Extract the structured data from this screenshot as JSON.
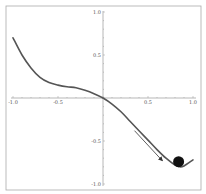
{
  "chart_data": {
    "type": "line",
    "title": "",
    "xlabel": "",
    "ylabel": "",
    "xlim": [
      -1.0,
      1.0
    ],
    "ylim": [
      -1.0,
      1.0
    ],
    "grid": false,
    "x_ticks": [
      "-1.0",
      "-0.5",
      "0.5",
      "1.0"
    ],
    "y_ticks": [
      "1.0",
      "0.5",
      "-0.5",
      "-1.0"
    ],
    "series": [
      {
        "name": "potential curve",
        "x": [
          -1.0,
          -0.9,
          -0.8,
          -0.7,
          -0.6,
          -0.5,
          -0.4,
          -0.3,
          -0.2,
          -0.1,
          0.0,
          0.1,
          0.2,
          0.3,
          0.4,
          0.5,
          0.6,
          0.7,
          0.8,
          0.85,
          0.9,
          1.0
        ],
        "y": [
          0.7,
          0.5,
          0.35,
          0.24,
          0.18,
          0.15,
          0.13,
          0.12,
          0.09,
          0.05,
          0.0,
          -0.07,
          -0.16,
          -0.27,
          -0.38,
          -0.49,
          -0.6,
          -0.7,
          -0.78,
          -0.8,
          -0.79,
          -0.72
        ]
      }
    ],
    "annotations": [
      {
        "type": "ball",
        "x": 0.84,
        "y": -0.74,
        "label": "ball"
      },
      {
        "type": "arrow",
        "from": [
          0.35,
          -0.38
        ],
        "to": [
          0.66,
          -0.73
        ],
        "label": "direction of motion"
      }
    ]
  },
  "axes": {
    "x_tick_labels": [
      "-1.0",
      "-0.5",
      "0.5",
      "1.0"
    ],
    "y_tick_labels": [
      "1.0",
      "0.5",
      "-0.5",
      "-1.0"
    ]
  },
  "colors": {
    "curve": "#555555",
    "axes": "#999999",
    "frame": "#aaaaaa",
    "ball": "#111111",
    "arrow": "#333333"
  }
}
